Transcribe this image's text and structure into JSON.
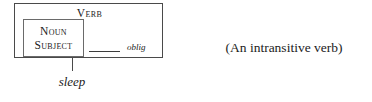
{
  "diagram": {
    "type": "construction-grammar-valency-diagram",
    "outer_box": {
      "label": "Verb"
    },
    "inner_box": {
      "line1": "Noun",
      "line2": "Subject"
    },
    "slot": {
      "blank": "",
      "tag": "oblig"
    },
    "filler": {
      "word": "sleep"
    },
    "gloss": {
      "text": "(An intransitive verb)"
    },
    "colors": {
      "background": "#ffffff",
      "text": "#1b1b1b",
      "outer_border": "#4a4a4a",
      "inner_border": "#6a6a6a",
      "rule": "#3d3d3d"
    }
  }
}
